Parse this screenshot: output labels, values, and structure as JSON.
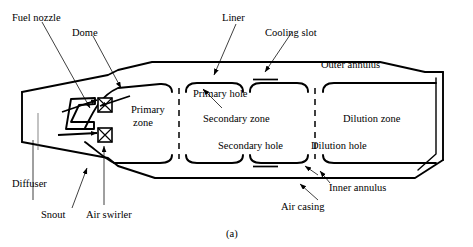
{
  "figure": {
    "caption": "(a)"
  },
  "labels": {
    "fuel_nozzle": "Fuel nozzle",
    "dome": "Dome",
    "liner": "Liner",
    "cooling_slot": "Cooling slot",
    "outer_annulus": "Outer annulus",
    "primary_hole": "Primary hole",
    "primary_zone_l1": "Primary",
    "primary_zone_l2": "zone",
    "secondary_zone": "Secondary zone",
    "dilution_zone": "Dilution zone",
    "secondary_hole": "Secondary hole",
    "dilution_hole": "Dilution hole",
    "inner_annulus": "Inner annulus",
    "air_casing": "Air casing",
    "diffuser": "Diffuser",
    "snout": "Snout",
    "air_swirler": "Air swirler"
  },
  "style": {
    "stroke": "#000000",
    "background": "#ffffff",
    "line_weight_heavy": 1.8,
    "line_weight_leader": 0.7
  }
}
